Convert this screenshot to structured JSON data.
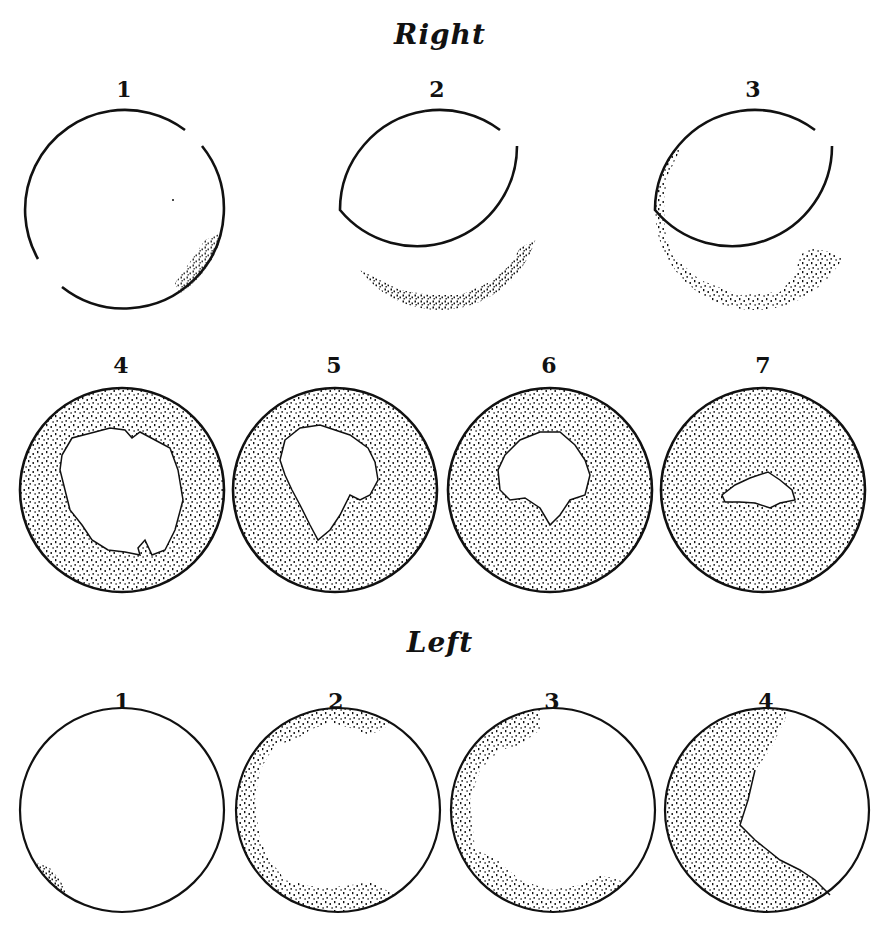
{
  "sections": {
    "right": {
      "title": "Right",
      "fields": [
        {
          "label": "1",
          "cx": 125,
          "cy": 210,
          "r": 100,
          "fill": "mostly-clear",
          "note": "scant stipple at lower right; rim broken top-right and lower-left"
        },
        {
          "label": "2",
          "cx": 440,
          "cy": 210,
          "r": 100,
          "fill": "mostly-clear",
          "note": "stipple along inferior rim and lower right; rim broken top-right"
        },
        {
          "label": "3",
          "cx": 755,
          "cy": 210,
          "r": 100,
          "fill": "mostly-clear",
          "note": "stipple along left rim, inferior rim and lower-right patch; rim broken top-right"
        },
        {
          "label": "4",
          "cx": 122,
          "cy": 490,
          "r": 102,
          "fill": "mostly-stippled",
          "note": "large irregular central clear area"
        },
        {
          "label": "5",
          "cx": 335,
          "cy": 490,
          "r": 102,
          "fill": "mostly-stippled",
          "note": "central clear area with lower point"
        },
        {
          "label": "6",
          "cx": 550,
          "cy": 490,
          "r": 102,
          "fill": "mostly-stippled",
          "note": "smaller central clear area"
        },
        {
          "label": "7",
          "cx": 763,
          "cy": 490,
          "r": 102,
          "fill": "mostly-stippled",
          "note": "small central clear island"
        }
      ]
    },
    "left": {
      "title": "Left",
      "fields": [
        {
          "label": "1",
          "cx": 122,
          "cy": 810,
          "r": 102,
          "fill": "mostly-clear",
          "note": "small stipple at lower left"
        },
        {
          "label": "2",
          "cx": 338,
          "cy": 810,
          "r": 102,
          "fill": "mostly-clear",
          "note": "stipple band around left, top and bottom rims"
        },
        {
          "label": "3",
          "cx": 553,
          "cy": 810,
          "r": 102,
          "fill": "partly-stippled",
          "note": "stipple on left, top-left and lower third"
        },
        {
          "label": "4",
          "cx": 767,
          "cy": 810,
          "r": 102,
          "fill": "mostly-stippled",
          "note": "clear upper-right sector only"
        }
      ]
    }
  },
  "colors": {
    "ink": "#111111",
    "paper": "#ffffff"
  }
}
